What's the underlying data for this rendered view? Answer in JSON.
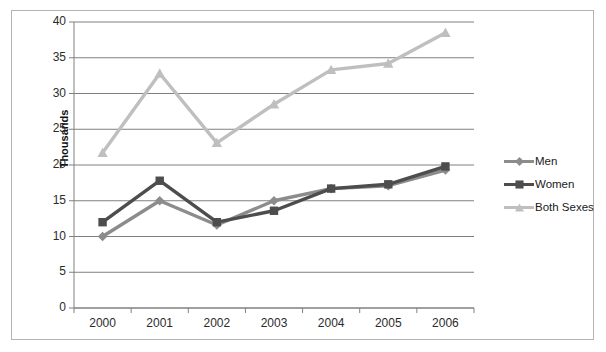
{
  "chart_data": {
    "type": "line",
    "title": "",
    "subtitle": "",
    "xlabel": "",
    "ylabel": "Thousands",
    "categories": [
      "2000",
      "2001",
      "2002",
      "2003",
      "2004",
      "2005",
      "2006"
    ],
    "ylim": [
      0,
      40
    ],
    "yticks": [
      0,
      5,
      10,
      15,
      20,
      25,
      30,
      35,
      40
    ],
    "ytick_labels": [
      "0",
      "5",
      "10",
      "15",
      "20",
      "25",
      "30",
      "35",
      "40"
    ],
    "grid": "horizontal",
    "legend_position": "right",
    "series": [
      {
        "name": "Men",
        "color": "#8c8c8c",
        "marker": "diamond",
        "values": [
          10.0,
          15.0,
          11.6,
          15.0,
          16.7,
          17.1,
          19.3
        ]
      },
      {
        "name": "Women",
        "color": "#4d4d4d",
        "marker": "square",
        "values": [
          12.0,
          17.8,
          12.0,
          13.6,
          16.7,
          17.3,
          19.8
        ]
      },
      {
        "name": "Both Sexes",
        "color": "#bfbfbf",
        "marker": "triangle",
        "values": [
          21.7,
          32.8,
          23.1,
          28.5,
          33.3,
          34.2,
          38.5
        ]
      }
    ]
  },
  "legend": {
    "items": [
      {
        "label": "Men"
      },
      {
        "label": "Women"
      },
      {
        "label": "Both Sexes"
      }
    ]
  },
  "axis": {
    "y_title": "Thousands"
  }
}
